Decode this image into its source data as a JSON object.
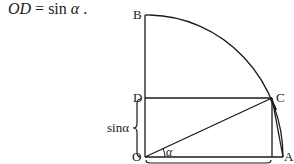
{
  "caption": {
    "lhs": "OD",
    "eq": " = sin ",
    "greek": "α",
    "tail": " ."
  },
  "points": {
    "O": {
      "label": "O",
      "x": 145,
      "y": 157
    },
    "A": {
      "label": "A",
      "x": 283,
      "y": 157
    },
    "B": {
      "label": "B",
      "x": 145,
      "y": 15
    },
    "C": {
      "label": "C",
      "x": 272,
      "y": 98
    },
    "D": {
      "label": "D",
      "x": 145,
      "y": 98
    }
  },
  "labels": {
    "sin_alpha": "sinα",
    "angle": "α"
  },
  "colors": {
    "stroke": "#1a1a1a",
    "background": "#ffffff"
  }
}
